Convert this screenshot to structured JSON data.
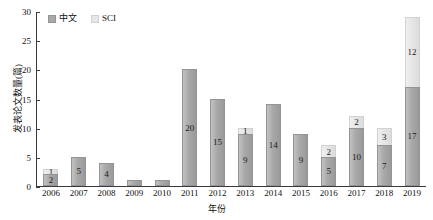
{
  "chart_data": {
    "type": "bar",
    "stacked": true,
    "title": "",
    "xlabel": "年份",
    "ylabel": "发表论文数量(篇)",
    "ylim": [
      0,
      30
    ],
    "yticks": [
      0,
      5,
      10,
      15,
      20,
      25,
      30
    ],
    "grid": false,
    "legend_position": "top-left",
    "categories": [
      "2006",
      "2007",
      "2008",
      "2009",
      "2010",
      "2011",
      "2012",
      "2013",
      "2014",
      "2015",
      "2016",
      "2017",
      "2018",
      "2019"
    ],
    "series": [
      {
        "name": "中文",
        "color": "#a8a8a8",
        "values": [
          2,
          5,
          4,
          1,
          1,
          20,
          15,
          9,
          14,
          9,
          5,
          10,
          7,
          17
        ],
        "labels": [
          "2",
          "5",
          "4",
          "",
          "",
          "20",
          "15",
          "9",
          "14",
          "9",
          "5",
          "10",
          "7",
          "17"
        ]
      },
      {
        "name": "SCI",
        "color": "#e6e6e6",
        "values": [
          1,
          0,
          0,
          0,
          0,
          0,
          0,
          1,
          0,
          0,
          2,
          2,
          3,
          12
        ],
        "labels": [
          "1",
          "",
          "",
          "",
          "",
          "",
          "",
          "1",
          "",
          "",
          "2",
          "2",
          "3",
          "12"
        ]
      }
    ],
    "totals": [
      3,
      5,
      4,
      1,
      1,
      20,
      15,
      10,
      14,
      9,
      7,
      12,
      10,
      29
    ]
  },
  "legend": {
    "items": [
      {
        "label": "中文",
        "swatch": "legend-swatch-cn"
      },
      {
        "label": "SCI",
        "swatch": "legend-swatch-sci"
      }
    ]
  }
}
